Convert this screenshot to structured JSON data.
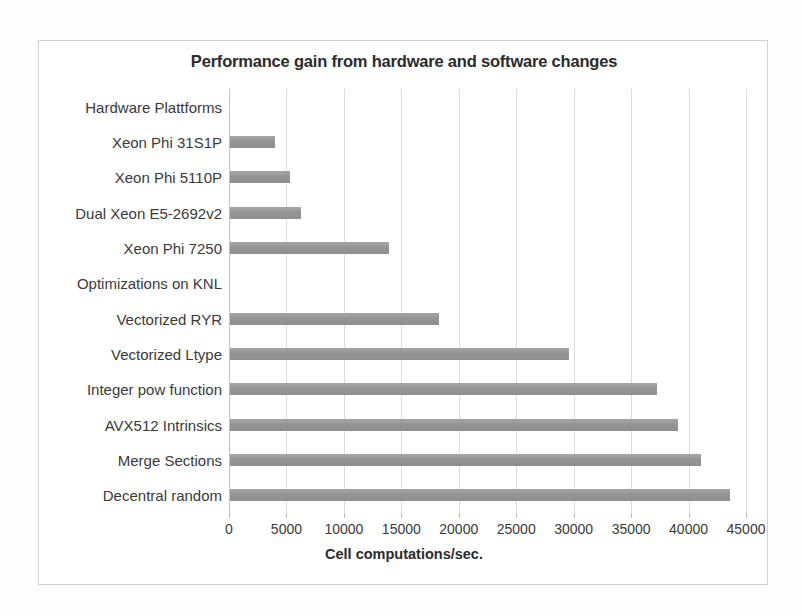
{
  "chart_data": {
    "type": "bar",
    "orientation": "horizontal",
    "title": "Performance gain from hardware and software changes",
    "xlabel": "Cell computations/sec.",
    "ylabel": "",
    "xlim": [
      0,
      45000
    ],
    "xticks": [
      0,
      5000,
      10000,
      15000,
      20000,
      25000,
      30000,
      35000,
      40000,
      45000
    ],
    "xtick_labels": [
      "0",
      "5000",
      "10000",
      "15000",
      "20000",
      "25000",
      "30000",
      "35000",
      "40000",
      "45000"
    ],
    "grid": "vertical",
    "legend": "none",
    "bar_color": "#9a9a9a",
    "categories": [
      "Hardware Plattforms",
      "Xeon Phi 31S1P",
      "Xeon Phi 5110P",
      "Dual Xeon E5-2692v2",
      "Xeon Phi 7250",
      "Optimizations on KNL",
      "Vectorized RYR",
      "Vectorized Ltype",
      "Integer pow function",
      "AVX512 Intrinsics",
      "Merge Sections",
      "Decentral random"
    ],
    "values": [
      null,
      3900,
      5200,
      6200,
      13800,
      null,
      18200,
      29500,
      37200,
      39000,
      41000,
      43500
    ],
    "group_headers": [
      "Hardware Plattforms",
      "Optimizations on KNL"
    ]
  }
}
